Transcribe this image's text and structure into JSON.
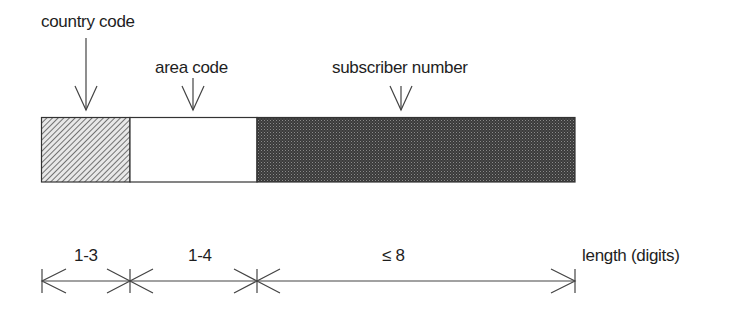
{
  "diagram": {
    "fields": [
      {
        "label": "country code",
        "length": "1-3",
        "fill": "hatched"
      },
      {
        "label": "area code",
        "length": "1-4",
        "fill": "white"
      },
      {
        "label": "subscriber number",
        "length": "≤ 8",
        "fill": "dark-dotted"
      }
    ],
    "axis_label": "length (digits)",
    "colors": {
      "line": "#333333",
      "dark_fill": "#3a3a3a",
      "hatch": "#555555"
    }
  }
}
